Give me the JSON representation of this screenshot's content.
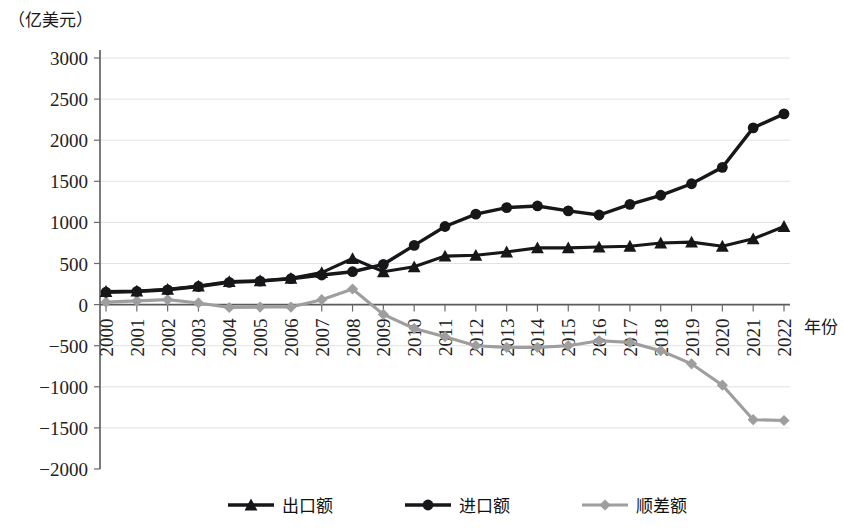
{
  "chart_data": {
    "type": "line",
    "title": "",
    "unit_label": "（亿美元）",
    "xlabel": "年份",
    "ylabel": "",
    "ylim": [
      -2000,
      3000
    ],
    "ytick_step": 500,
    "yticks": [
      "3000",
      "2500",
      "2000",
      "1500",
      "1000",
      "500",
      "0",
      "-500",
      "-1000",
      "-1500",
      "-2000"
    ],
    "ytick_values": [
      3000,
      2500,
      2000,
      1500,
      1000,
      500,
      0,
      -500,
      -1000,
      -1500,
      -2000
    ],
    "grid": true,
    "legend_position": "bottom",
    "categories": [
      "2000",
      "2001",
      "2002",
      "2003",
      "2004",
      "2005",
      "2006",
      "2007",
      "2008",
      "2009",
      "2010",
      "2011",
      "2012",
      "2013",
      "2014",
      "2015",
      "2016",
      "2017",
      "2018",
      "2019",
      "2020",
      "2021",
      "2022"
    ],
    "series": [
      {
        "name": "出口额",
        "marker": "triangle",
        "color": "#17171a",
        "values": [
          160,
          165,
          185,
          225,
          280,
          290,
          320,
          390,
          560,
          400,
          460,
          590,
          600,
          640,
          690,
          690,
          700,
          710,
          750,
          760,
          710,
          800,
          950
        ]
      },
      {
        "name": "进口额",
        "marker": "circle",
        "color": "#17171a",
        "values": [
          150,
          160,
          180,
          220,
          270,
          285,
          315,
          360,
          400,
          490,
          720,
          950,
          1100,
          1180,
          1200,
          1140,
          1090,
          1220,
          1330,
          1470,
          1670,
          2150,
          2320
        ]
      },
      {
        "name": "顺差额",
        "marker": "diamond",
        "color": "#9e9e9e",
        "values": [
          30,
          45,
          60,
          20,
          -35,
          -30,
          -30,
          60,
          190,
          -120,
          -290,
          -390,
          -500,
          -520,
          -520,
          -500,
          -440,
          -460,
          -560,
          -720,
          -980,
          -1400,
          -1410
        ]
      }
    ]
  },
  "legend": {
    "items": [
      {
        "label": "出口额",
        "marker": "triangle",
        "color": "#17171a"
      },
      {
        "label": "进口额",
        "marker": "circle",
        "color": "#17171a"
      },
      {
        "label": "顺差额",
        "marker": "diamond",
        "color": "#9e9e9e"
      }
    ]
  }
}
